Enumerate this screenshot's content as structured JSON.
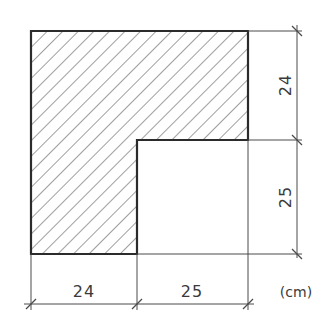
{
  "drawing": {
    "shape": "L-shaped hatched cross-section",
    "units_label": "(cm)",
    "dimensions": {
      "bottom_left": "24",
      "bottom_right": "25",
      "right_top": "24",
      "right_bottom": "25"
    },
    "colors": {
      "outline": "#2b2b2b",
      "hatch": "#6a6a6a",
      "dimension_line": "#4a4a4a",
      "text": "#3a3a3a",
      "background": "#ffffff"
    }
  }
}
